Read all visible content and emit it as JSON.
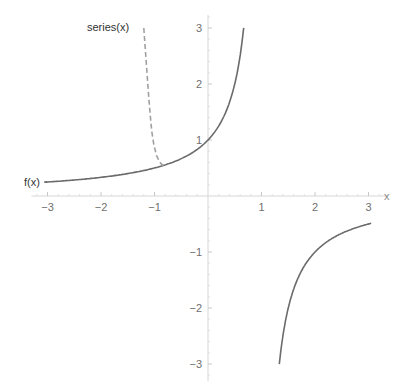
{
  "chart_data": {
    "type": "line",
    "title": "",
    "xlabel": "x",
    "ylabel": "",
    "xlim": [
      -3.3,
      3.3
    ],
    "ylim": [
      -3.2,
      3.2
    ],
    "x_ticks": [
      -3,
      -2,
      -1,
      1,
      2,
      3
    ],
    "y_ticks": [
      -3,
      -2,
      -1,
      1,
      2,
      3
    ],
    "x_tick_labels": [
      "−3",
      "−2",
      "−1",
      "1",
      "2",
      "3"
    ],
    "y_tick_labels": [
      "−3",
      "−2",
      "−1",
      "1",
      "2",
      "3"
    ],
    "grid": false,
    "series": [
      {
        "name": "f(x)",
        "label": "f(x)",
        "expression": "1/(1-x)",
        "style": "solid",
        "color": "#6b6b6b",
        "segments": [
          {
            "x_range": [
              -3.05,
              0.667
            ]
          },
          {
            "x_range": [
              1.333,
              3.05
            ]
          }
        ]
      },
      {
        "name": "series(x)",
        "label": "series(x)",
        "style": "dashed",
        "color": "#a0a0a0",
        "points": [
          [
            -1.2,
            3.0
          ],
          [
            -1.17,
            2.6
          ],
          [
            -1.14,
            2.2
          ],
          [
            -1.11,
            1.8
          ],
          [
            -1.08,
            1.45
          ],
          [
            -1.05,
            1.15
          ],
          [
            -1.01,
            0.9
          ],
          [
            -0.96,
            0.72
          ],
          [
            -0.9,
            0.6
          ],
          [
            -0.84,
            0.545
          ],
          [
            -0.78,
            0.562
          ]
        ]
      }
    ]
  }
}
